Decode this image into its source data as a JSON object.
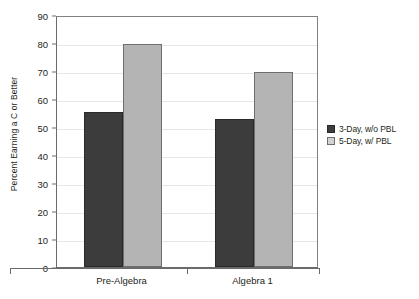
{
  "chart_data": {
    "type": "bar",
    "title": "",
    "subtitle": "",
    "xlabel": "",
    "ylabel": "Percent Earning a C or Better",
    "categories": [
      "Pre-Algebra",
      "Algebra 1"
    ],
    "series": [
      {
        "name": "3-Day, w/o PBL",
        "color": "#3c3c3c",
        "values": [
          55.2,
          52.8
        ]
      },
      {
        "name": "5-Day, w/ PBL",
        "color": "#b4b4b4",
        "values": [
          79.5,
          69.7
        ]
      }
    ],
    "ylim": [
      0,
      90
    ],
    "yticks": [
      0,
      10,
      20,
      30,
      40,
      50,
      60,
      70,
      80,
      90
    ],
    "ytick_labels": [
      "0",
      "10",
      "20",
      "30",
      "40",
      "50",
      "60",
      "70",
      "80",
      "90"
    ],
    "grid": true,
    "grid_axis": "y",
    "legend_position": "right",
    "bar_gap_groups": true
  },
  "legend": {
    "items": [
      {
        "label": "3-Day, w/o PBL"
      },
      {
        "label": "5-Day, w/ PBL"
      }
    ]
  }
}
